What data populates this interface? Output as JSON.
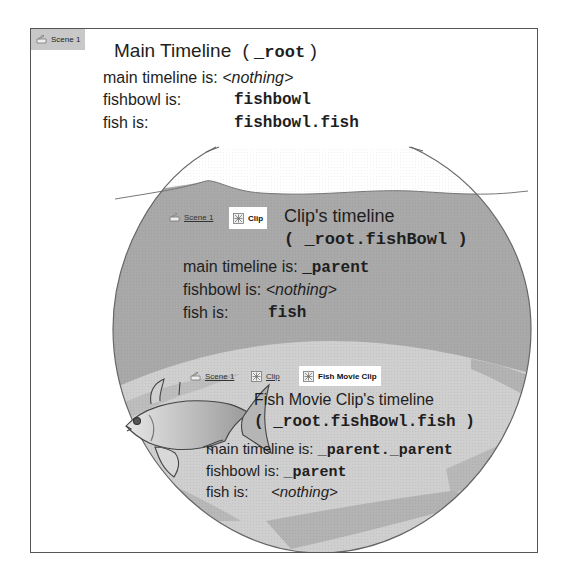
{
  "colors": {
    "frame_border": "#555555",
    "bowl_outline": "#666666",
    "water_dark": "#a9a9a9",
    "water_light": "#cfcfcf",
    "water_streak": "#b8b8b8",
    "breadcrumb_root_bg": "#c8c8c8",
    "breadcrumb_active_bg": "#ffffff"
  },
  "root": {
    "breadcrumb": [
      {
        "label": "Scene 1",
        "icon": "scene-icon",
        "state": "active"
      }
    ],
    "title": "Main Timeline",
    "title_paren_open": "(",
    "title_path": "_root",
    "title_paren_close": ")",
    "lines": [
      {
        "label": "main timeline is:",
        "value": "<nothing>",
        "value_style": "italic"
      },
      {
        "label": "fishbowl is:",
        "value": "fishbowl",
        "value_style": "code"
      },
      {
        "label": "fish is:",
        "value": "fishbowl.fish",
        "value_style": "code"
      }
    ]
  },
  "clip": {
    "breadcrumb": [
      {
        "label": "Scene 1",
        "icon": "scene-icon",
        "state": "link"
      },
      {
        "label": "Clip",
        "icon": "movie-clip-icon",
        "state": "active"
      }
    ],
    "title": "Clip's timeline",
    "path_line": "( _root.fishBowl )",
    "lines": [
      {
        "label": "main timeline is:",
        "value": "_parent",
        "value_style": "code"
      },
      {
        "label": "fishbowl is:",
        "value": "<nothing>",
        "value_style": "italic"
      },
      {
        "label": "fish is:",
        "value": "fish",
        "value_style": "code"
      }
    ]
  },
  "fish": {
    "breadcrumb": [
      {
        "label": "Scene 1",
        "icon": "scene-icon",
        "state": "link"
      },
      {
        "label": "Clip",
        "icon": "movie-clip-icon",
        "state": "link"
      },
      {
        "label": "Fish Movie Clip",
        "icon": "movie-clip-icon",
        "state": "active"
      }
    ],
    "title": "Fish Movie Clip's timeline",
    "path_line": "( _root.fishBowl.fish )",
    "lines": [
      {
        "label": "main timeline is:",
        "value": "_parent._parent",
        "value_style": "code"
      },
      {
        "label": "fishbowl is:",
        "value": "_parent",
        "value_style": "code"
      },
      {
        "label": "fish is:",
        "value": "<nothing>",
        "value_style": "italic"
      }
    ]
  }
}
